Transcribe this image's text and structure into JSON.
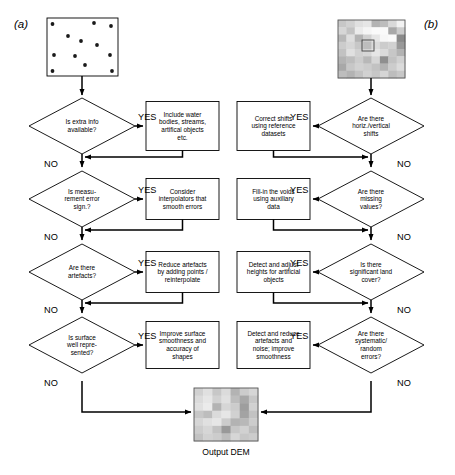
{
  "figure": {
    "panel_a_label": "(a)",
    "panel_b_label": "(b)",
    "output_caption": "Output DEM",
    "yes_label": "YES",
    "no_label": "NO"
  },
  "chart_data": {
    "type": "diagram",
    "panels": [
      {
        "id": "a",
        "label": "(a)",
        "input_node": "point-cloud-raster",
        "input_description": "scattered points in a square box"
      },
      {
        "id": "b",
        "label": "(b)",
        "input_node": "gridded-dem-raster",
        "input_description": "greyscale raster grid"
      }
    ],
    "left_branch": {
      "decisions": [
        "Is extra info available?",
        "Is measu-rement error sign.?",
        "Are there artefacts?",
        "Is surface well repre-sented?"
      ],
      "actions": [
        "Include water bodies, streams, artifical objects etc.",
        "Consider interpolators that smooth errors",
        "Reduce artefacts by adding points / reinterpolate",
        "Improve surface smoothness and accuracy of shapes"
      ]
    },
    "right_branch": {
      "decisions": [
        "Are there horiz./vertical shifts",
        "Are there missing values?",
        "Is there significant land cover?",
        "Are there systematic/ random errors?"
      ],
      "actions": [
        "Correct shifts using reference datasets",
        "Fill-in the voids using auxiliary data",
        "Detect and adjust heights for artificial objects",
        "Detect and reduce artefacts and noise; improve smoothness"
      ]
    },
    "terminal": "Output DEM"
  },
  "left": {
    "decisions": [
      {
        "id": "d1",
        "lines": [
          "Is extra info",
          "available?"
        ]
      },
      {
        "id": "d2",
        "lines": [
          "Is measu-",
          "rement error",
          "sign.?"
        ]
      },
      {
        "id": "d3",
        "lines": [
          "Are there",
          "artefacts?"
        ]
      },
      {
        "id": "d4",
        "lines": [
          "Is surface",
          "well repre-",
          "sented?"
        ]
      }
    ],
    "actions": [
      {
        "id": "a1",
        "lines": [
          "Include water",
          "bodies, streams,",
          "artifical objects",
          "etc."
        ]
      },
      {
        "id": "a2",
        "lines": [
          "Consider",
          "interpolators that",
          "smooth errors"
        ]
      },
      {
        "id": "a3",
        "lines": [
          "Reduce artefacts",
          "by adding points /",
          "reinterpolate"
        ]
      },
      {
        "id": "a4",
        "lines": [
          "Improve surface",
          "smoothness and",
          "accuracy of",
          "shapes"
        ]
      }
    ]
  },
  "right": {
    "decisions": [
      {
        "id": "rd1",
        "lines": [
          "Are there",
          "horiz./vertical",
          "shifts"
        ]
      },
      {
        "id": "rd2",
        "lines": [
          "Are there",
          "missing",
          "values?"
        ]
      },
      {
        "id": "rd3",
        "lines": [
          "Is there",
          "significant land",
          "cover?"
        ]
      },
      {
        "id": "rd4",
        "lines": [
          "Are there",
          "systematic/",
          "random",
          "errors?"
        ]
      }
    ],
    "actions": [
      {
        "id": "ra1",
        "lines": [
          "Correct shifts",
          "using reference",
          "datasets"
        ]
      },
      {
        "id": "ra2",
        "lines": [
          "Fill-in the voids",
          "using auxiliary",
          "data"
        ]
      },
      {
        "id": "ra3",
        "lines": [
          "Detect and adjust",
          "heights for artificial",
          "objects"
        ]
      },
      {
        "id": "ra4",
        "lines": [
          "Detect and reduce",
          "artefacts and",
          "noise; improve",
          "smoothness"
        ]
      }
    ]
  },
  "colors": {
    "stroke": "#000000",
    "fill": "#ffffff",
    "dot": "#1a1a1a"
  }
}
